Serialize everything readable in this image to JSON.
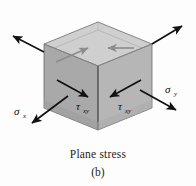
{
  "figure": {
    "name": "plane-stress-element",
    "caption_title": "Plane stress",
    "caption_sub": "(b)",
    "colors": {
      "top_face": "#cfcfcf",
      "left_face": "#a8a8a8",
      "right_face": "#b5b5b5",
      "inner_face": "#dcdcdc",
      "edge": "#555555",
      "arrow": "#111111",
      "gray_arrow": "#8c8c8c",
      "text": "#1d1d1d",
      "background": "#fdfdfd"
    }
  },
  "labels": {
    "sigma_x": {
      "symbol": "σ",
      "subscript": "x"
    },
    "sigma_y": {
      "symbol": "σ",
      "subscript": "y"
    },
    "tau_xy_left": {
      "symbol": "τ",
      "subscript": "xy"
    },
    "tau_xy_right": {
      "symbol": "τ",
      "subscript": "xy"
    }
  },
  "arrows": {
    "sigma_x_label": "sigma-x stress arrow pointing lower-left",
    "sigma_x_back_label": "sigma-x stress arrow pointing upper-left",
    "sigma_y_label": "sigma-y stress arrow pointing lower-right",
    "sigma_y_back_label": "sigma-y stress arrow pointing upper-right",
    "tau_xy_left_label": "tau-xy shear arrow pointing lower-right on left face",
    "tau_xy_right_label": "tau-xy shear arrow pointing lower-left on right face",
    "tau_top_left_label": "tau-xy shear arrow on top face pointing upper-right",
    "tau_top_right_label": "tau-xy shear arrow on top face pointing left"
  }
}
